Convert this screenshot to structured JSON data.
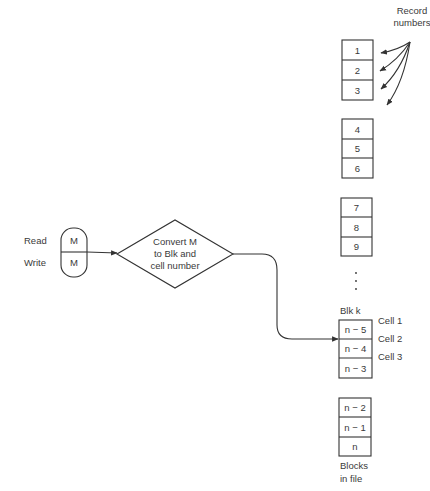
{
  "diagram": {
    "record_numbers_label": [
      "Record",
      "numbers"
    ],
    "inputs": {
      "read_label": "Read",
      "write_label": "Write",
      "read_value": "M",
      "write_value": "M"
    },
    "process": {
      "lines": [
        "Convert M",
        "to Blk and",
        "cell number"
      ]
    },
    "blocks": [
      {
        "cells": [
          "1",
          "2",
          "3"
        ]
      },
      {
        "cells": [
          "4",
          "5",
          "6"
        ]
      },
      {
        "cells": [
          "7",
          "8",
          "9"
        ]
      },
      {
        "label": "Blk k",
        "cells": [
          "n − 5",
          "n − 4",
          "n − 3"
        ]
      },
      {
        "cells": [
          "n − 2",
          "n − 1",
          "n"
        ]
      }
    ],
    "ellipsis": "⋮",
    "cell_labels": [
      "Cell 1",
      "Cell 2",
      "Cell 3"
    ],
    "footer_label": [
      "Blocks",
      "in file"
    ]
  }
}
